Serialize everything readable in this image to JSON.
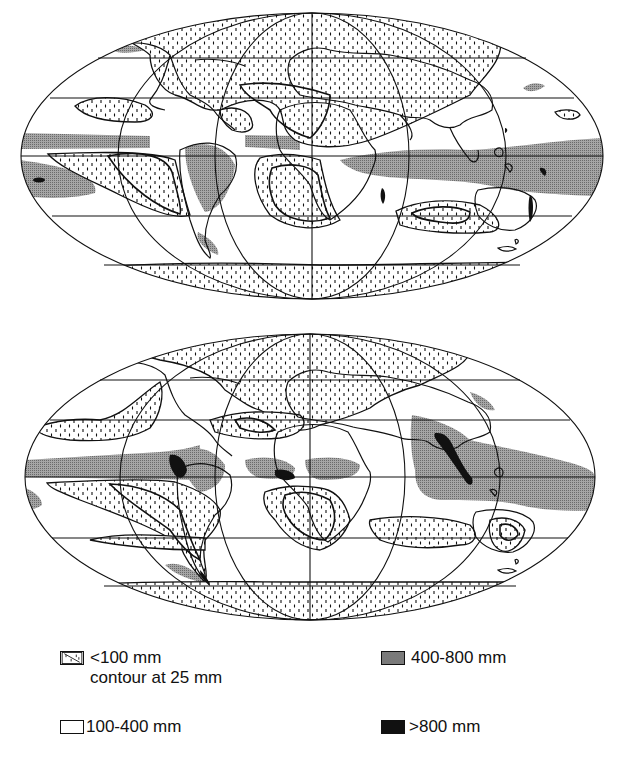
{
  "figure": {
    "maps": [
      {
        "id": "top",
        "description": "Annual precipitation map, Mollweide world projection (upper panel)"
      },
      {
        "id": "bottom",
        "description": "Annual precipitation map, Mollweide world projection (lower panel)"
      }
    ]
  },
  "legend": {
    "items": [
      {
        "key": "dry",
        "label": "<100 mm",
        "sublabel": "contour at 25 mm",
        "pattern": "dashed-dots",
        "color": "#ffffff"
      },
      {
        "key": "wet",
        "label": "400-800 mm",
        "pattern": "fine-stipple",
        "color": "#9a9a9a"
      },
      {
        "key": "mid",
        "label": "100-400 mm",
        "pattern": "blank",
        "color": "#ffffff"
      },
      {
        "key": "vwet",
        "label": ">800 mm",
        "pattern": "solid",
        "color": "#111111"
      }
    ]
  },
  "colors": {
    "outline": "#111111",
    "stipple": "#9a9a9a",
    "solid": "#111111",
    "background": "#ffffff"
  }
}
